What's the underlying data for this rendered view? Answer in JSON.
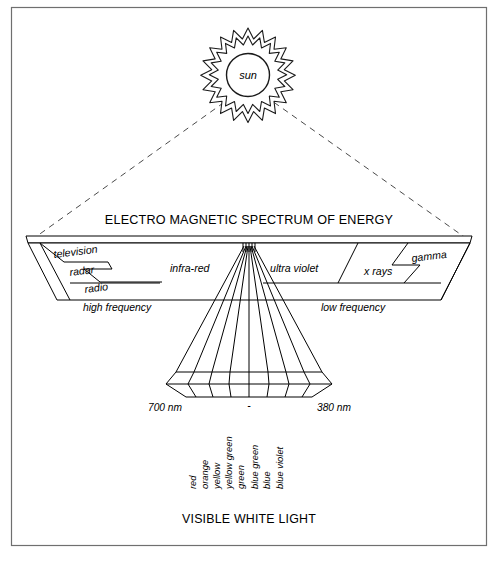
{
  "diagram": {
    "title": "ELECTRO MAGNETIC SPECTRUM OF ENERGY",
    "caption": "VISIBLE WHITE LIGHT",
    "sun_label": "sun",
    "frequency_labels": {
      "high": "high frequency",
      "low": "low frequency"
    },
    "wavelength_labels": {
      "left": "700 nm",
      "center": "-",
      "right": "380 nm"
    },
    "spectrum_bands": [
      {
        "label": "television",
        "side": "left"
      },
      {
        "label": "radar",
        "side": "left"
      },
      {
        "label": "radio",
        "side": "left"
      },
      {
        "label": "infra-red",
        "side": "left"
      },
      {
        "label": "ultra violet",
        "side": "right"
      },
      {
        "label": "x rays",
        "side": "right"
      },
      {
        "label": "gamma",
        "side": "right"
      }
    ],
    "visible_colors": [
      "red",
      "orange",
      "yellow",
      "yellow green",
      "green",
      "blue green",
      "blue",
      "blue violet"
    ],
    "colors": {
      "ink": "#000000",
      "paper": "#ffffff",
      "frame": "#6f6f6f",
      "dashed_ray": "#4a4a4a"
    }
  }
}
